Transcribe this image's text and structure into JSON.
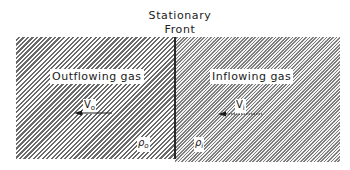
{
  "title": {
    "line1": "Stationary",
    "line2": "Front"
  },
  "left_region": {
    "label": "Outflowing gas",
    "velocity_symbol": "V",
    "velocity_subscript": "o",
    "density_symbol": "ρ",
    "density_subscript": "o",
    "arrow_direction": "left",
    "hatch": "wide diagonal"
  },
  "right_region": {
    "label": "Inflowing gas",
    "velocity_symbol": "V",
    "velocity_subscript": "i",
    "density_symbol": "ρ",
    "density_subscript": "i",
    "arrow_direction": "left",
    "hatch": "fine diagonal"
  },
  "colors": {
    "hatch_left": "#6a6a6a",
    "hatch_right": "#7e7e7e",
    "front_line": "#2a2a2a",
    "background": "#ffffff"
  }
}
